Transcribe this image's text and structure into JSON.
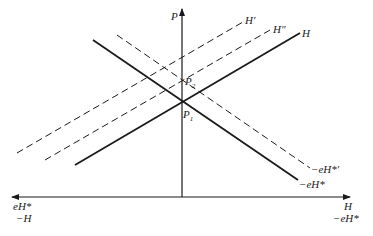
{
  "diagram": {
    "axes": {
      "vertical_label": "P",
      "right_label_top": "H",
      "right_label_bottom": "−eH*",
      "left_label_top": "eH*",
      "left_label_bottom": "−H"
    },
    "lines": {
      "H": "H",
      "H_prime": "H′",
      "H_double_prime": "H″",
      "neg_eH_star": "−eH*",
      "neg_eH_star_prime": "−eH*′"
    },
    "points": {
      "P1": {
        "base": "P",
        "sub": "1"
      },
      "P2": {
        "base": "P",
        "sub": "2"
      }
    },
    "colors": {
      "ink": "#1a1a1a",
      "background": "#ffffff"
    }
  }
}
